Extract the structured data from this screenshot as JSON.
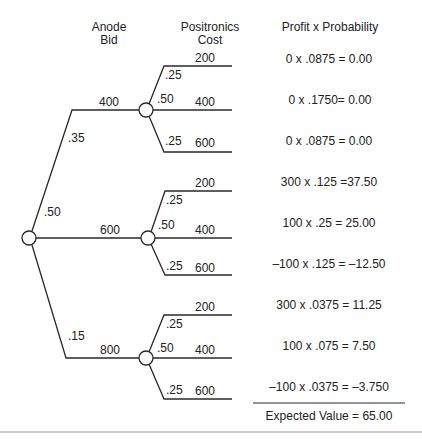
{
  "headers": {
    "anode_bid_line1": "Anode",
    "anode_bid_line2": "Bid",
    "positronics_cost_line1": "Positronics",
    "positronics_cost_line2": "Cost",
    "profit_probability": "Profit x Probability"
  },
  "root": {
    "branches": [
      {
        "probability": ".35",
        "bid": "400",
        "outcomes": [
          {
            "probability": ".25",
            "cost": "200",
            "calc": "0 x .0875 = 0.00"
          },
          {
            "probability": ".50",
            "cost": "400",
            "calc": "0 x .1750= 0.00"
          },
          {
            "probability": ".25",
            "cost": "600",
            "calc": "0 x .0875 = 0.00"
          }
        ]
      },
      {
        "probability": ".50",
        "bid": "600",
        "outcomes": [
          {
            "probability": ".25",
            "cost": "200",
            "calc": "300 x .125 =37.50"
          },
          {
            "probability": ".50",
            "cost": "400",
            "calc": "100 x .25 = 25.00"
          },
          {
            "probability": ".25",
            "cost": "600",
            "calc": "–100 x .125 = –12.50"
          }
        ]
      },
      {
        "probability": ".15",
        "bid": "800",
        "outcomes": [
          {
            "probability": ".25",
            "cost": "200",
            "calc": "300 x .0375 = 11.25"
          },
          {
            "probability": ".50",
            "cost": "400",
            "calc": "100 x .075 = 7.50"
          },
          {
            "probability": ".25",
            "cost": "600",
            "calc": "–100 x .0375 = –3.750"
          }
        ]
      }
    ]
  },
  "summary": {
    "expected_value": "Expected Value = 65.00"
  },
  "colors": {
    "line": "#2a2a2a",
    "text": "#222222",
    "background": "#ffffff",
    "rule": "#9a9a9a"
  }
}
